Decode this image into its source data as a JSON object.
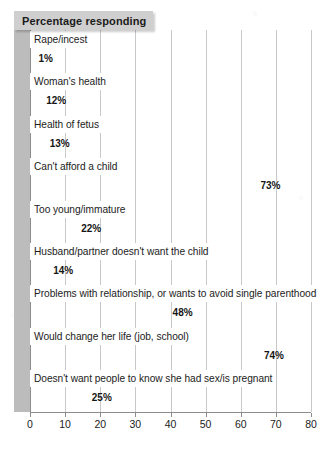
{
  "chart": {
    "banner_title": "Percentage responding",
    "axis": {
      "x_ticks": [
        0,
        10,
        20,
        30,
        40,
        50,
        60,
        70,
        80
      ]
    },
    "colors": {
      "bar_top": "#8f8f8f",
      "bar_bottom": "#cdcdcd",
      "banner_background": "#cfcfcf",
      "gridline": "#c9c9c9",
      "gutter": "#bcbcbc",
      "text": "#1c1c1c",
      "background": "#ffffff"
    }
  },
  "chart_data": {
    "type": "bar",
    "orientation": "horizontal",
    "title": "Percentage responding",
    "xlabel": "",
    "ylabel": "",
    "xlim": [
      0,
      80
    ],
    "grid": true,
    "legend": "none",
    "categories": [
      "Rape/incest",
      "Woman's health",
      "Health of fetus",
      "Can't afford a child",
      "Too young/immature",
      "Husband/partner doesn't want the child",
      "Problems with relationship, or wants to avoid single parenthood",
      "Would change her life (job, school)",
      "Doesn't want people to know she had sex/is pregnant"
    ],
    "values": [
      1,
      12,
      13,
      73,
      22,
      14,
      48,
      74,
      25
    ],
    "value_labels": [
      "1%",
      "12%",
      "13%",
      "73%",
      "22%",
      "14%",
      "48%",
      "74%",
      "25%"
    ],
    "label_placement": [
      "outside",
      "inside",
      "inside",
      "inside",
      "inside",
      "inside",
      "inside",
      "inside",
      "inside"
    ],
    "xtick_labels": [
      "0",
      "10",
      "20",
      "30",
      "40",
      "50",
      "60",
      "70",
      "80"
    ]
  }
}
